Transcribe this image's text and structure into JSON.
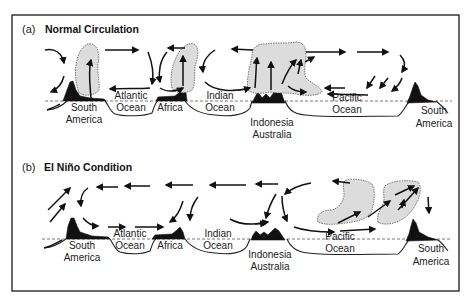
{
  "figure": {
    "panels": [
      {
        "letter": "(a)",
        "title": "Normal Circulation",
        "labels": {
          "south_america_west": [
            "South",
            "America"
          ],
          "atlantic": [
            "Atlantic",
            "Ocean"
          ],
          "africa": [
            "Africa"
          ],
          "indian": [
            "Indian",
            "Ocean"
          ],
          "indonesia": [
            "Indonesia",
            "Australia"
          ],
          "pacific": [
            "Pacific",
            "Ocean"
          ],
          "south_america_east": [
            "South",
            "America"
          ]
        }
      },
      {
        "letter": "(b)",
        "title": "El Niño Condition",
        "labels": {
          "south_america_west": [
            "South",
            "America"
          ],
          "atlantic": [
            "Atlantic",
            "Ocean"
          ],
          "africa": [
            "Africa"
          ],
          "indian": [
            "Indian",
            "Ocean"
          ],
          "indonesia": [
            "Indonesia",
            "Australia"
          ],
          "pacific": [
            "Pacific",
            "Ocean"
          ],
          "south_america_east": [
            "South",
            "America"
          ]
        }
      }
    ],
    "colors": {
      "land": "#111111",
      "cloud": "#dcdcdc",
      "background": "#ffffff"
    }
  }
}
